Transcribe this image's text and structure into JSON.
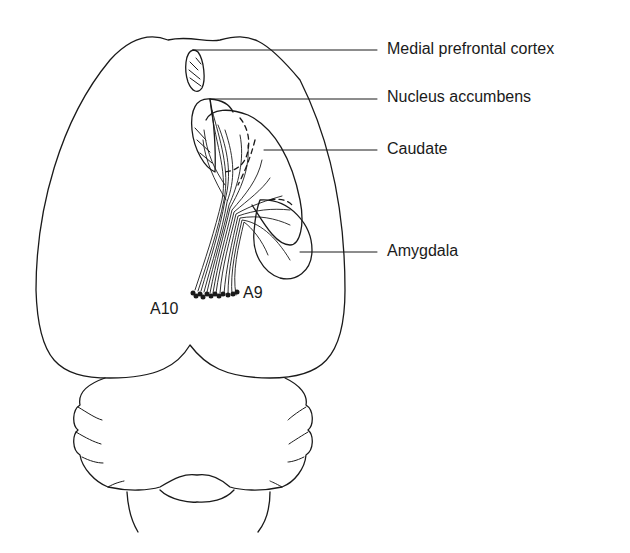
{
  "diagram": {
    "type": "anatomical-schematic",
    "stroke_color": "#1a1a1a",
    "background": "#ffffff",
    "labels": {
      "medial_prefrontal_cortex": "Medial prefrontal cortex",
      "nucleus_accumbens": "Nucleus accumbens",
      "caudate": "Caudate",
      "amygdala": "Amygdala",
      "a10": "A10",
      "a9": "A9"
    },
    "structures": [
      "cerebral-hemispheres",
      "medial-prefrontal-cortex",
      "nucleus-accumbens",
      "caudate",
      "amygdala",
      "dopaminergic-fiber-bundle",
      "cell-groups-a9-a10",
      "cerebellum",
      "brainstem"
    ]
  }
}
